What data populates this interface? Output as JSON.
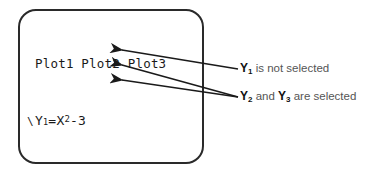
{
  "calculator": {
    "plots_header": "Plot1 Plot2 Plot3",
    "equations": [
      {
        "var": "Y",
        "index": "1",
        "sign": "=",
        "expr_pre": "X",
        "sup": "2",
        "expr_post": "-3",
        "selected": false,
        "cursor": false
      },
      {
        "var": "Y",
        "index": "2",
        "sign": "=",
        "expr_pre": "2X+5",
        "sup": "",
        "expr_post": "",
        "selected": true,
        "cursor": false
      },
      {
        "var": "Y",
        "index": "3",
        "sign": "=",
        "expr_pre": "6/X",
        "sup": "",
        "expr_post": "",
        "selected": true,
        "cursor": true
      },
      {
        "var": "Y",
        "index": "4",
        "sign": "=",
        "expr_pre": "",
        "sup": "",
        "expr_post": "",
        "selected": false,
        "cursor": false
      },
      {
        "var": "Y",
        "index": "5",
        "sign": "=",
        "expr_pre": "",
        "sup": "",
        "expr_post": "",
        "selected": false,
        "cursor": false
      },
      {
        "var": "Y",
        "index": "6",
        "sign": "=",
        "expr_pre": "",
        "sup": "",
        "expr_post": "",
        "selected": false,
        "cursor": false
      },
      {
        "var": "Y",
        "index": "7",
        "sign": "=",
        "expr_pre": "",
        "sup": "",
        "expr_post": "",
        "selected": false,
        "cursor": false
      }
    ]
  },
  "annotations": {
    "not_selected": {
      "var1": "Y",
      "sub1": "1",
      "text": " is not selected"
    },
    "selected": {
      "var1": "Y",
      "sub1": "2",
      "mid": " and ",
      "var2": "Y",
      "sub2": "3",
      "text": " are selected"
    }
  },
  "colors": {
    "frame": "#2a2a2a",
    "text": "#1a1a1a",
    "label_text": "#555555"
  }
}
